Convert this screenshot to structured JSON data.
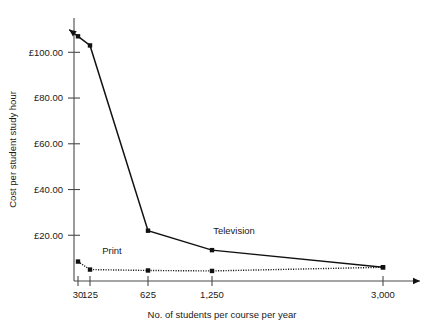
{
  "chart_data": {
    "type": "line",
    "title": "",
    "xlabel": "No. of students per course per year",
    "ylabel": "Cost per student study hour",
    "x_categories": [
      "30",
      "125",
      "625",
      "1,250",
      "3,000"
    ],
    "x_values": [
      30,
      125,
      625,
      1250,
      3000
    ],
    "y_tick_labels": [
      "£20.00",
      "£40.00",
      "£60.00",
      "£80.00",
      "£100.00"
    ],
    "y_tick_values": [
      20,
      40,
      60,
      80,
      100
    ],
    "ylim": [
      0,
      115
    ],
    "grid": false,
    "legend_position": "inline-annotations",
    "currency_symbol": "£",
    "series": [
      {
        "name": "Television",
        "style": "solid",
        "marker": "square",
        "has_start_arrow": true,
        "has_end_arrow": true,
        "values": [
          107.0,
          103.0,
          22.0,
          13.5,
          6.0
        ]
      },
      {
        "name": "Print",
        "style": "dotted",
        "marker": "square",
        "has_start_arrow": false,
        "has_end_arrow": true,
        "values": [
          8.5,
          5.0,
          4.6,
          4.4,
          6.0
        ]
      }
    ],
    "annotations": [
      {
        "text": "Print",
        "x_value": 125,
        "y_value": 12.0
      },
      {
        "text": "Television",
        "x_value": 1250,
        "y_value": 20.5
      }
    ]
  },
  "colors": {
    "line": "#111111",
    "axis": "#4a4a4a",
    "text": "#1a1a1a",
    "background": "#ffffff"
  }
}
